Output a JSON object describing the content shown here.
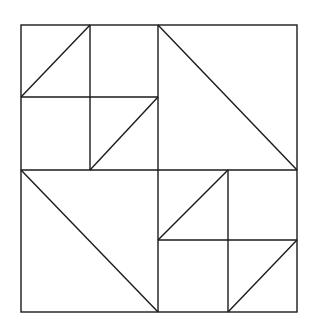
{
  "diagram": {
    "title": "",
    "stroke_color": "#1a1a1a",
    "background": "#ffffff",
    "outer_square": {
      "x1": 21,
      "y1": 25,
      "x2": 297,
      "y2": 312
    },
    "quadrants": [
      {
        "name": "top-left",
        "type": "four-patch with diagonals"
      },
      {
        "name": "top-right",
        "type": "half-square triangle"
      },
      {
        "name": "bottom-left",
        "type": "half-square triangle"
      },
      {
        "name": "bottom-right",
        "type": "four-patch with diagonals"
      }
    ]
  }
}
